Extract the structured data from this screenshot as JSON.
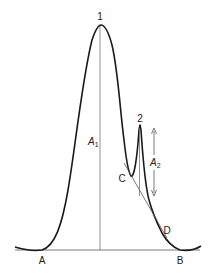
{
  "diagram": {
    "type": "chromatogram-peak-area",
    "labels": {
      "peak1": "1",
      "peak2": "2",
      "area1_main": "A",
      "area1_sub": "1",
      "area2_main": "A",
      "area2_sub": "2",
      "point_a": "A",
      "point_b": "B",
      "point_c": "C",
      "point_d": "D"
    },
    "colors": {
      "curve": "#1a1a1a",
      "thin_line": "#555555",
      "text": "#222222",
      "background": "#ffffff"
    }
  }
}
